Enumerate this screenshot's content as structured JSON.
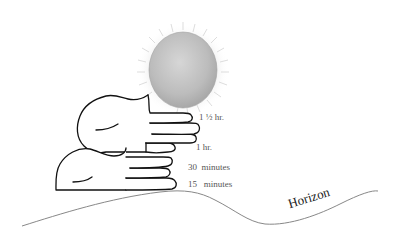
{
  "diagram": {
    "type": "hand-width sunset estimation",
    "colors": {
      "background": "#ffffff",
      "sun_fill": "#bdbdbd",
      "sun_rays": "#d0d0d0",
      "hand_stroke": "#111111",
      "horizon_stroke": "#888888",
      "label_text": "#555555"
    },
    "labels": [
      {
        "id": "one-and-half-hour",
        "text": "1 ½ hr."
      },
      {
        "id": "one-hour",
        "text": "1 hr."
      },
      {
        "id": "thirty-minutes",
        "text": "30  minutes"
      },
      {
        "id": "fifteen-minutes",
        "text": "15   minutes"
      }
    ],
    "horizon_label": "Horizon",
    "icons": {
      "sun": "sun-icon",
      "upper_hand": "hand-icon",
      "lower_hand": "hand-icon"
    }
  }
}
